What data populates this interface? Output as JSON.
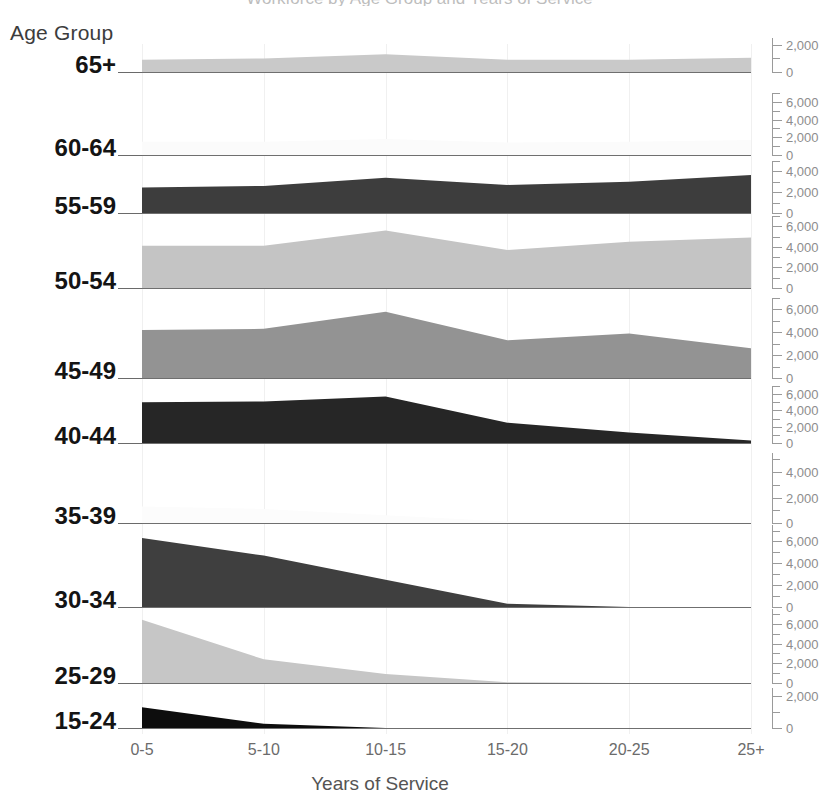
{
  "chart_data": {
    "type": "area",
    "title": "Workforce by Age Group and Years of Service",
    "xlabel": "Years of Service",
    "ylabel": "Age Group",
    "categories": [
      "0-5",
      "5-10",
      "10-15",
      "15-20",
      "20-25",
      "25+"
    ],
    "grid": true,
    "legend_position": "none",
    "panel_order_top_to_bottom": [
      "65+",
      "60-64",
      "55-59",
      "50-54",
      "45-49",
      "40-44",
      "35-39",
      "30-34",
      "25-29",
      "15-24"
    ],
    "series": [
      {
        "name": "65+",
        "color": "#c9c9c9",
        "ylim": [
          0,
          2500
        ],
        "yticks": [
          0,
          2000
        ],
        "ytick_labels": [
          "0",
          "2,000"
        ],
        "values": [
          900,
          1000,
          1300,
          900,
          900,
          1050
        ]
      },
      {
        "name": "60-64",
        "color": "#fbfbfb",
        "ylim": [
          0,
          7000
        ],
        "yticks": [
          0,
          2000,
          4000,
          6000
        ],
        "ytick_labels": [
          "0",
          "2,000",
          "4,000",
          "6,000"
        ],
        "values": [
          1500,
          1500,
          1800,
          1400,
          1500,
          1700
        ]
      },
      {
        "name": "55-59",
        "color": "#3d3d3d",
        "ylim": [
          0,
          5000
        ],
        "yticks": [
          0,
          2000,
          4000
        ],
        "ytick_labels": [
          "0",
          "2,000",
          "4,000"
        ],
        "values": [
          2450,
          2600,
          3400,
          2700,
          3000,
          3650
        ]
      },
      {
        "name": "50-54",
        "color": "#c4c4c4",
        "ylim": [
          0,
          7000
        ],
        "yticks": [
          0,
          2000,
          4000,
          6000
        ],
        "ytick_labels": [
          "0",
          "2,000",
          "4,000",
          "6,000"
        ],
        "values": [
          4100,
          4100,
          5600,
          3700,
          4500,
          4900
        ]
      },
      {
        "name": "45-49",
        "color": "#939393",
        "ylim": [
          0,
          7000
        ],
        "yticks": [
          0,
          2000,
          4000,
          6000
        ],
        "ytick_labels": [
          "0",
          "2,000",
          "4,000",
          "6,000"
        ],
        "values": [
          4200,
          4300,
          5800,
          3300,
          3900,
          2600
        ]
      },
      {
        "name": "40-44",
        "color": "#262626",
        "ylim": [
          0,
          7000
        ],
        "yticks": [
          0,
          2000,
          4000,
          6000
        ],
        "ytick_labels": [
          "0",
          "2,000",
          "4,000",
          "6,000"
        ],
        "values": [
          5000,
          5100,
          5700,
          2500,
          1300,
          300
        ]
      },
      {
        "name": "35-39",
        "color": "#fcfcfc",
        "ylim": [
          0,
          5500
        ],
        "yticks": [
          0,
          2000,
          4000
        ],
        "ytick_labels": [
          "0",
          "2,000",
          "4,000"
        ],
        "values": [
          1300,
          1100,
          600,
          120,
          40,
          20
        ]
      },
      {
        "name": "30-34",
        "color": "#3f3f3f",
        "ylim": [
          0,
          7500
        ],
        "yticks": [
          0,
          2000,
          4000,
          6000
        ],
        "ytick_labels": [
          "0",
          "2,000",
          "4,000",
          "6,000"
        ],
        "values": [
          6300,
          4700,
          2500,
          300,
          0,
          0
        ]
      },
      {
        "name": "25-29",
        "color": "#c6c6c6",
        "ylim": [
          0,
          7500
        ],
        "yticks": [
          0,
          2000,
          4000,
          6000
        ],
        "ytick_labels": [
          "0",
          "2,000",
          "4,000",
          "6,000"
        ],
        "values": [
          6400,
          2400,
          900,
          80,
          0,
          0
        ]
      },
      {
        "name": "15-24",
        "color": "#0d0d0d",
        "ylim": [
          0,
          2500
        ],
        "yticks": [
          0,
          2000
        ],
        "ytick_labels": [
          "0",
          "2,000"
        ],
        "values": [
          1300,
          260,
          0,
          0,
          0,
          0
        ]
      }
    ]
  },
  "axes": {
    "left_title": "Age Group",
    "bottom_title": "Years of Service"
  }
}
